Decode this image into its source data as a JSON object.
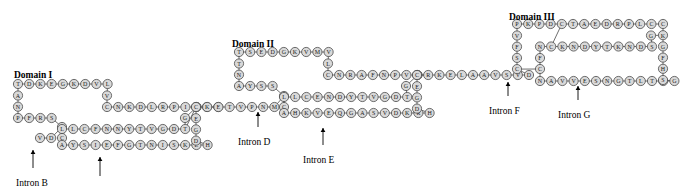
{
  "figure": {
    "type": "protein-domain-sequence-diagram",
    "residue_radius": 4.6,
    "circle_fill": "#d9d9d9",
    "circle_stroke": "#4a4a4a",
    "background": "#ffffff"
  },
  "domain_labels": [
    {
      "text": "Domain I",
      "x": 14,
      "y": 70
    },
    {
      "text": "Domain II",
      "x": 232,
      "y": 39
    },
    {
      "text": "Domain III",
      "x": 509,
      "y": 12
    }
  ],
  "intron_labels": [
    {
      "text": "Intron B",
      "x": 16,
      "y": 178,
      "arrow_x": 33,
      "arrow_y0": 168,
      "arrow_y1": 150
    },
    {
      "text": "Intron C",
      "x": 80,
      "y": 186,
      "arrow_x": 100,
      "arrow_y0": 176,
      "arrow_y1": 157
    },
    {
      "text": "Intron D",
      "x": 238,
      "y": 137,
      "arrow_x": 258,
      "arrow_y0": 127,
      "arrow_y1": 112
    },
    {
      "text": "Intron E",
      "x": 303,
      "y": 155,
      "arrow_x": 323,
      "arrow_y0": 145,
      "arrow_y1": 128
    },
    {
      "text": "Intron F",
      "x": 489,
      "y": 106,
      "arrow_x": 508,
      "arrow_y0": 96,
      "arrow_y1": 82
    },
    {
      "text": "Intron G",
      "x": 558,
      "y": 110,
      "arrow_x": 578,
      "arrow_y0": 100,
      "arrow_y1": 86
    }
  ],
  "chains": [
    {
      "id": "d1-top",
      "residues": [
        "T",
        "D",
        "K",
        "E",
        "G",
        "K",
        "D",
        "V",
        "L"
      ],
      "start_x": 18,
      "start_y": 84,
      "dx": 11.2,
      "dy": 0
    },
    {
      "id": "d1-left",
      "residues": [
        "A",
        "N"
      ],
      "start_x": 18,
      "start_y": 95.5,
      "dx": 0,
      "dy": 11.2
    },
    {
      "id": "d1-left-lower",
      "residues": [
        "P",
        "F",
        "R",
        "S"
      ],
      "start_x": 18,
      "start_y": 118,
      "dx": 11.2,
      "dy": 0
    },
    {
      "id": "d1-c-hinge",
      "residues": [
        "C"
      ],
      "start_x": 62,
      "start_y": 127,
      "dx": 0,
      "dy": 0
    },
    {
      "id": "d1-vd",
      "residues": [
        "V",
        "D"
      ],
      "start_x": 40,
      "start_y": 138,
      "dx": 11.2,
      "dy": 0
    },
    {
      "id": "d1-c-lower",
      "residues": [
        "C"
      ],
      "start_x": 62,
      "start_y": 138,
      "dx": 0,
      "dy": 0
    },
    {
      "id": "d1-right-down",
      "residues": [
        "V"
      ],
      "start_x": 107,
      "start_y": 95.5,
      "dx": 0,
      "dy": 0
    },
    {
      "id": "d1-mid",
      "residues": [
        "C",
        "N",
        "K",
        "D",
        "L",
        "R",
        "P",
        "I",
        "C"
      ],
      "start_x": 107,
      "start_y": 107,
      "dx": 11.2,
      "dy": 0
    },
    {
      "id": "d1-g",
      "residues": [
        "G"
      ],
      "start_x": 185,
      "start_y": 118,
      "dx": 0,
      "dy": 0
    },
    {
      "id": "d1-row3",
      "residues": [
        "L",
        "L",
        "C",
        "F",
        "N",
        "N",
        "Y",
        "T",
        "V",
        "G",
        "D",
        "T"
      ],
      "start_x": 62,
      "start_y": 129,
      "dx": 11.2,
      "dy": 0
    },
    {
      "id": "d1-row4",
      "residues": [
        "A",
        "Y",
        "S",
        "I",
        "E",
        "F",
        "G",
        "T",
        "N",
        "I",
        "S",
        "K",
        "E",
        "H"
      ],
      "start_x": 62,
      "start_y": 145,
      "dx": 11.2,
      "dy": 0
    },
    {
      "id": "d1-rightcol",
      "residues": [
        "C",
        "E",
        "G",
        "D"
      ],
      "start_x": 196,
      "start_y": 107,
      "dx": 0,
      "dy": 11.2
    },
    {
      "id": "d1-connector",
      "residues": [
        "K",
        "E"
      ],
      "start_x": 207,
      "start_y": 107,
      "dx": 11.2,
      "dy": 0
    },
    {
      "id": "link-1",
      "residues": [
        "C",
        "K",
        "E",
        "T",
        "V",
        "P",
        "N",
        "M"
      ],
      "start_x": 196,
      "start_y": 107,
      "dx": 11.2,
      "dy": 0
    },
    {
      "id": "d2-top",
      "residues": [
        "T",
        "S",
        "E",
        "D",
        "G",
        "K",
        "V",
        "M",
        "V"
      ],
      "start_x": 239,
      "start_y": 52,
      "dx": 11.2,
      "dy": 0
    },
    {
      "id": "d2-left",
      "residues": [
        "T",
        "N"
      ],
      "start_x": 239,
      "start_y": 63.5,
      "dx": 0,
      "dy": 11.2
    },
    {
      "id": "d2-row",
      "residues": [
        "A",
        "Y",
        "S",
        "S"
      ],
      "start_x": 239,
      "start_y": 86,
      "dx": 11.2,
      "dy": 0
    },
    {
      "id": "d2-c1",
      "residues": [
        "C"
      ],
      "start_x": 284,
      "start_y": 96,
      "dx": 0,
      "dy": 0
    },
    {
      "id": "d2-c2",
      "residues": [
        "C"
      ],
      "start_x": 284,
      "start_y": 107,
      "dx": 0,
      "dy": 0
    },
    {
      "id": "d2-l",
      "residues": [
        "L"
      ],
      "start_x": 328,
      "start_y": 63.5,
      "dx": 0,
      "dy": 0
    },
    {
      "id": "d2-mid",
      "residues": [
        "C",
        "N",
        "R",
        "A",
        "F",
        "N",
        "P",
        "V",
        "C"
      ],
      "start_x": 328,
      "start_y": 75,
      "dx": 11.2,
      "dy": 0
    },
    {
      "id": "d2-g",
      "residues": [
        "G"
      ],
      "start_x": 406,
      "start_y": 86,
      "dx": 0,
      "dy": 0
    },
    {
      "id": "d2-row3",
      "residues": [
        "L",
        "L",
        "C",
        "E",
        "N",
        "D",
        "Y",
        "T",
        "V",
        "G",
        "D",
        "T"
      ],
      "start_x": 284,
      "start_y": 97,
      "dx": 11.2,
      "dy": 0
    },
    {
      "id": "d2-row4",
      "residues": [
        "A",
        "H",
        "K",
        "V",
        "E",
        "Q",
        "G",
        "A",
        "S",
        "V",
        "D",
        "K",
        "R",
        "H"
      ],
      "start_x": 284,
      "start_y": 113,
      "dx": 11.2,
      "dy": 0
    },
    {
      "id": "d2-rightcol",
      "residues": [
        "C",
        "E",
        "G",
        "D"
      ],
      "start_x": 417,
      "start_y": 75,
      "dx": 0,
      "dy": 11.2
    },
    {
      "id": "link-2",
      "residues": [
        "C",
        "R",
        "K",
        "E",
        "L",
        "A",
        "A",
        "V",
        "S",
        "V",
        "D"
      ],
      "start_x": 417,
      "start_y": 75,
      "dx": 11.2,
      "dy": 0
    },
    {
      "id": "d3-top",
      "residues": [
        "P",
        "K",
        "P",
        "D",
        "C",
        "T",
        "A",
        "E",
        "D",
        "R",
        "P",
        "L",
        "C"
      ],
      "start_x": 517,
      "start_y": 24,
      "dx": 11.2,
      "dy": 0
    },
    {
      "id": "d3-left",
      "residues": [
        "V",
        "F",
        "S",
        "C"
      ],
      "start_x": 517,
      "start_y": 35.5,
      "dx": 0,
      "dy": 11.2
    },
    {
      "id": "d3-mid",
      "residues": [
        "N",
        "C",
        "K",
        "N",
        "D",
        "Y",
        "T",
        "K",
        "N",
        "D",
        "S"
      ],
      "start_x": 540,
      "start_y": 46.5,
      "dx": 11.2,
      "dy": 0
    },
    {
      "id": "d3-f",
      "residues": [
        "F"
      ],
      "start_x": 540,
      "start_y": 58,
      "dx": 0,
      "dy": 0
    },
    {
      "id": "d3-c",
      "residues": [
        "C"
      ],
      "start_x": 540,
      "start_y": 69,
      "dx": 0,
      "dy": 0
    },
    {
      "id": "d3-g2",
      "residues": [
        "G"
      ],
      "start_x": 651,
      "start_y": 35.5,
      "dx": 0,
      "dy": 0
    },
    {
      "id": "d3-row4",
      "residues": [
        "N",
        "A",
        "V",
        "V",
        "E",
        "S",
        "N",
        "G",
        "T",
        "L",
        "T",
        "L",
        "G"
      ],
      "start_x": 540,
      "start_y": 81,
      "dx": 11.2,
      "dy": 0
    },
    {
      "id": "d3-rightcol",
      "residues": [
        "C",
        "K",
        "G",
        "F",
        "H",
        "S"
      ],
      "start_x": 663,
      "start_y": 24,
      "dx": 0,
      "dy": 11.2
    }
  ]
}
